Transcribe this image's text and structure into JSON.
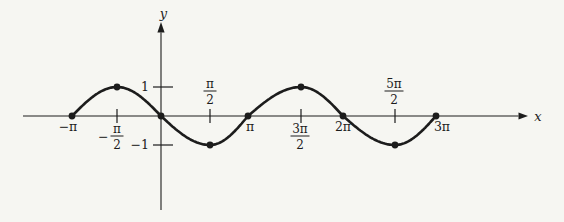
{
  "figure": {
    "background_color": "#f6f6f2",
    "ink_color": "#1c1c1c"
  },
  "chart_data": {
    "type": "line",
    "curve": "y = -sin(x)",
    "xlabel": "x",
    "ylabel": "y",
    "x_range_pi": [
      -1,
      3
    ],
    "ylim": [
      -1,
      1
    ],
    "grid": false,
    "points": [
      {
        "x_pi": -1,
        "y": 0
      },
      {
        "x_pi": -0.5,
        "y": 1
      },
      {
        "x_pi": 0,
        "y": 0
      },
      {
        "x_pi": 0.5,
        "y": -1
      },
      {
        "x_pi": 1,
        "y": 0
      },
      {
        "x_pi": 1.5,
        "y": 1
      },
      {
        "x_pi": 2,
        "y": 0
      },
      {
        "x_pi": 2.5,
        "y": -1
      },
      {
        "x_pi": 3,
        "y": 0
      }
    ],
    "x_ticks": [
      {
        "x_pi": -1,
        "side": "below",
        "tick_mark": false,
        "label": {
          "kind": "plain",
          "text": "−π"
        }
      },
      {
        "x_pi": -0.5,
        "side": "below",
        "tick_mark": true,
        "label": {
          "kind": "fraction",
          "prefix": "−",
          "num": "π",
          "den": "2"
        }
      },
      {
        "x_pi": 0.5,
        "side": "above",
        "tick_mark": true,
        "label": {
          "kind": "fraction",
          "prefix": "",
          "num": "π",
          "den": "2"
        }
      },
      {
        "x_pi": 1,
        "side": "below",
        "tick_mark": false,
        "label": {
          "kind": "plain",
          "text": "π"
        }
      },
      {
        "x_pi": 1.5,
        "side": "below",
        "tick_mark": true,
        "label": {
          "kind": "fraction",
          "prefix": "",
          "num": "3π",
          "den": "2"
        }
      },
      {
        "x_pi": 2,
        "side": "below",
        "tick_mark": false,
        "label": {
          "kind": "plain",
          "text": "2π"
        }
      },
      {
        "x_pi": 2.5,
        "side": "above",
        "tick_mark": true,
        "label": {
          "kind": "fraction",
          "prefix": "",
          "num": "5π",
          "den": "2"
        }
      },
      {
        "x_pi": 3,
        "side": "below",
        "tick_mark": false,
        "label": {
          "kind": "plain",
          "text": "3π"
        }
      }
    ],
    "y_ticks": [
      {
        "y": 1,
        "label": "1"
      },
      {
        "y": -1,
        "label": "−1"
      }
    ]
  }
}
